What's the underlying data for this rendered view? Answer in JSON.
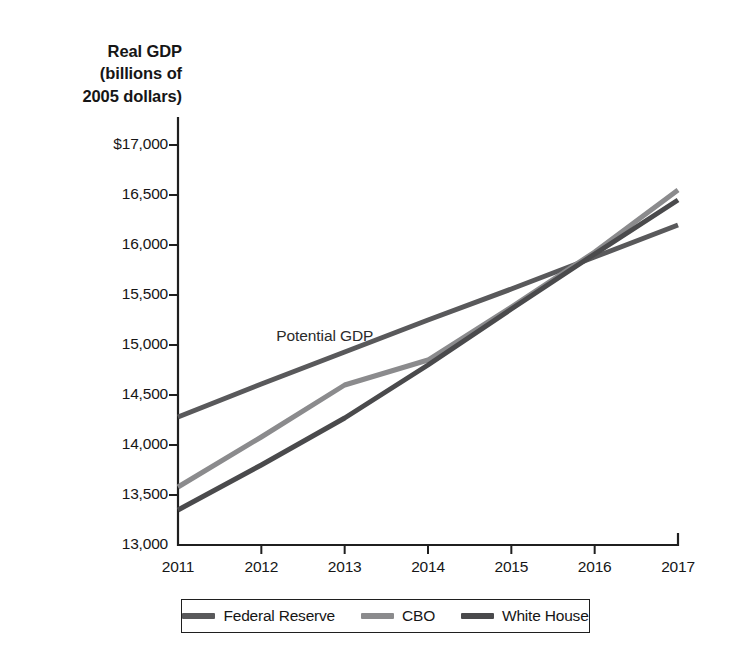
{
  "chart_data": {
    "type": "line",
    "title": "",
    "ylabel": "Real GDP\n(billions of\n2005 dollars)",
    "xlabel": "",
    "x": [
      2011,
      2012,
      2013,
      2014,
      2015,
      2016,
      2017
    ],
    "xlim": [
      2011,
      2017
    ],
    "ylim": [
      13000,
      17000
    ],
    "ytick_labels": [
      "$17,000",
      "16,500",
      "16,000",
      "15,500",
      "15,000",
      "14,500",
      "14,000",
      "13,500",
      "13,000"
    ],
    "ytick_values": [
      17000,
      16500,
      16000,
      15500,
      15000,
      14500,
      14000,
      13500,
      13000
    ],
    "xtick_labels": [
      "2011",
      "2012",
      "2013",
      "2014",
      "2015",
      "2016",
      "2017"
    ],
    "grid": false,
    "legend_position": "bottom",
    "annotations": [
      {
        "text": "Potential GDP",
        "x": 2012.18,
        "y": 15080
      }
    ],
    "series": [
      {
        "name": "Federal Reserve",
        "color": "#59595b",
        "values": [
          14280,
          14610,
          14930,
          15250,
          15560,
          15880,
          16200
        ]
      },
      {
        "name": "CBO",
        "color": "#8b8b8d",
        "values": [
          13580,
          14080,
          14600,
          14850,
          15380,
          15930,
          16550
        ]
      },
      {
        "name": "White House",
        "color": "#4a4a4c",
        "values": [
          13350,
          13800,
          14270,
          14800,
          15360,
          15910,
          16450
        ]
      }
    ]
  },
  "legend": {
    "entries": [
      {
        "label": "Federal Reserve",
        "color": "#59595b"
      },
      {
        "label": "CBO",
        "color": "#8b8b8d"
      },
      {
        "label": "White House",
        "color": "#4a4a4c"
      }
    ]
  },
  "axis": {
    "line_color": "#1f1f1f"
  }
}
